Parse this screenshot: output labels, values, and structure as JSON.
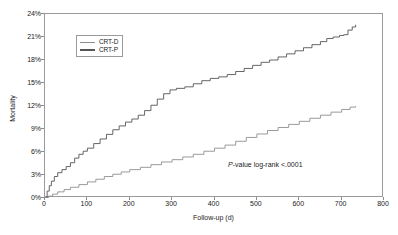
{
  "chart_data": {
    "type": "line",
    "title": "",
    "subtitle": "",
    "xlabel": "Follow-up (d)",
    "ylabel": "Mortality",
    "xlim": [
      0,
      800
    ],
    "ylim": [
      0,
      24
    ],
    "xticks": [
      0,
      100,
      200,
      300,
      400,
      500,
      600,
      700,
      800
    ],
    "xtick_labels": [
      "0",
      "100",
      "200",
      "300",
      "400",
      "500",
      "600",
      "700",
      "800"
    ],
    "yticks": [
      0,
      3,
      6,
      9,
      12,
      15,
      18,
      21,
      24
    ],
    "ytick_labels": [
      "0%",
      "3%",
      "6%",
      "9%",
      "12%",
      "15%",
      "18%",
      "21%",
      "24%"
    ],
    "grid": false,
    "legend_position": "upper-left-inside",
    "curve_style": "kaplan-meier-step",
    "annotations": [
      {
        "name": "log-rank-pvalue",
        "italic_prefix": "P",
        "text": "-value log-rank  <.0001",
        "full_text": "P-value log-rank  <.0001",
        "x": 470,
        "y": 4.3
      }
    ],
    "series": [
      {
        "name": "CRT-D",
        "color": "#8f8f8f",
        "legend_label": "CRT-D",
        "points": [
          [
            0,
            0.0
          ],
          [
            8,
            0.25
          ],
          [
            18,
            0.5
          ],
          [
            30,
            0.8
          ],
          [
            45,
            1.1
          ],
          [
            60,
            1.4
          ],
          [
            80,
            1.75
          ],
          [
            100,
            2.1
          ],
          [
            120,
            2.45
          ],
          [
            140,
            2.8
          ],
          [
            160,
            3.1
          ],
          [
            180,
            3.4
          ],
          [
            200,
            3.7
          ],
          [
            225,
            4.0
          ],
          [
            250,
            4.35
          ],
          [
            275,
            4.7
          ],
          [
            300,
            5.0
          ],
          [
            325,
            5.35
          ],
          [
            350,
            5.7
          ],
          [
            375,
            6.1
          ],
          [
            400,
            6.5
          ],
          [
            425,
            6.9
          ],
          [
            450,
            7.4
          ],
          [
            475,
            7.9
          ],
          [
            500,
            8.35
          ],
          [
            525,
            8.8
          ],
          [
            550,
            9.2
          ],
          [
            575,
            9.6
          ],
          [
            600,
            10.0
          ],
          [
            625,
            10.4
          ],
          [
            650,
            10.8
          ],
          [
            675,
            11.2
          ],
          [
            700,
            11.55
          ],
          [
            720,
            11.85
          ],
          [
            733,
            12.0
          ]
        ]
      },
      {
        "name": "CRT-P",
        "color": "#555555",
        "legend_label": "CRT-P",
        "points": [
          [
            0,
            0.0
          ],
          [
            5,
            0.9
          ],
          [
            10,
            1.6
          ],
          [
            15,
            2.2
          ],
          [
            22,
            2.8
          ],
          [
            30,
            3.3
          ],
          [
            40,
            3.7
          ],
          [
            50,
            4.1
          ],
          [
            60,
            4.6
          ],
          [
            70,
            5.2
          ],
          [
            80,
            5.7
          ],
          [
            90,
            6.1
          ],
          [
            100,
            6.5
          ],
          [
            115,
            7.1
          ],
          [
            130,
            7.7
          ],
          [
            145,
            8.3
          ],
          [
            160,
            8.9
          ],
          [
            175,
            9.4
          ],
          [
            190,
            9.9
          ],
          [
            205,
            10.3
          ],
          [
            220,
            10.8
          ],
          [
            235,
            11.4
          ],
          [
            250,
            12.1
          ],
          [
            265,
            12.9
          ],
          [
            280,
            13.6
          ],
          [
            295,
            14.1
          ],
          [
            310,
            14.3
          ],
          [
            330,
            14.5
          ],
          [
            350,
            14.9
          ],
          [
            370,
            15.3
          ],
          [
            390,
            15.6
          ],
          [
            410,
            15.8
          ],
          [
            430,
            16.1
          ],
          [
            450,
            16.5
          ],
          [
            470,
            16.9
          ],
          [
            490,
            17.3
          ],
          [
            510,
            17.7
          ],
          [
            530,
            18.0
          ],
          [
            550,
            18.4
          ],
          [
            570,
            18.8
          ],
          [
            590,
            19.2
          ],
          [
            610,
            19.6
          ],
          [
            630,
            20.0
          ],
          [
            650,
            20.4
          ],
          [
            665,
            20.8
          ],
          [
            680,
            21.0
          ],
          [
            695,
            21.2
          ],
          [
            705,
            21.3
          ],
          [
            715,
            21.9
          ],
          [
            725,
            22.3
          ],
          [
            733,
            22.6
          ]
        ]
      }
    ]
  }
}
